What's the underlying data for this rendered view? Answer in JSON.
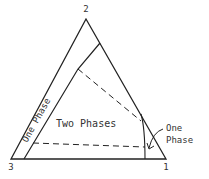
{
  "diagram": {
    "type": "ternary-phase-diagram",
    "vertices": {
      "top": "2",
      "bottom_left": "3",
      "bottom_right": "1"
    },
    "regions": {
      "two_phase_label": "Two Phases",
      "left_one_phase_label": "One Phase",
      "right_one_phase_label_line1": "One",
      "right_one_phase_label_line2": "Phase"
    },
    "tie_lines": 2,
    "colors": {
      "line": "#222222",
      "text": "#333333",
      "background": "#ffffff"
    }
  }
}
